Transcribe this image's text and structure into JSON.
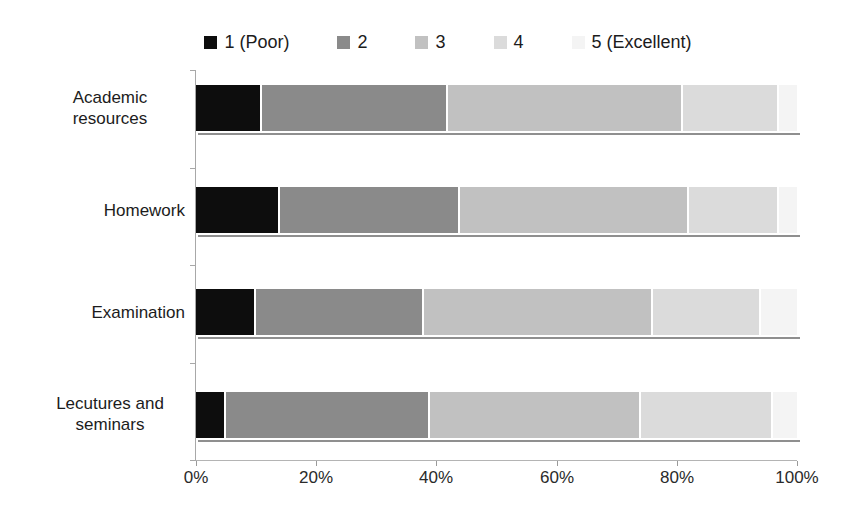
{
  "chart_data": {
    "type": "bar",
    "orientation": "horizontal",
    "stacked": true,
    "unit": "percent",
    "title": "",
    "xlabel": "",
    "ylabel": "",
    "categories": [
      "Academic resources",
      "Homework",
      "Examination",
      "Lecutures and seminars"
    ],
    "series": [
      {
        "name": "1 (Poor)",
        "color": "#0d0d0d",
        "values": [
          11,
          14,
          10,
          5
        ]
      },
      {
        "name": "2",
        "color": "#8a8a8a",
        "values": [
          31,
          30,
          28,
          34
        ]
      },
      {
        "name": "3",
        "color": "#c1c1c1",
        "values": [
          39,
          38,
          38,
          35
        ]
      },
      {
        "name": "4",
        "color": "#dbdbdb",
        "values": [
          16,
          15,
          18,
          22
        ]
      },
      {
        "name": "5 (Excellent)",
        "color": "#f4f4f4",
        "values": [
          3,
          3,
          6,
          4
        ]
      }
    ],
    "x_axis": {
      "range": [
        0,
        100
      ],
      "tick_labels": [
        "0%",
        "20%",
        "40%",
        "60%",
        "80%",
        "100%"
      ]
    },
    "legend_position": "top",
    "grid": false,
    "background_color": "#ffffff"
  }
}
